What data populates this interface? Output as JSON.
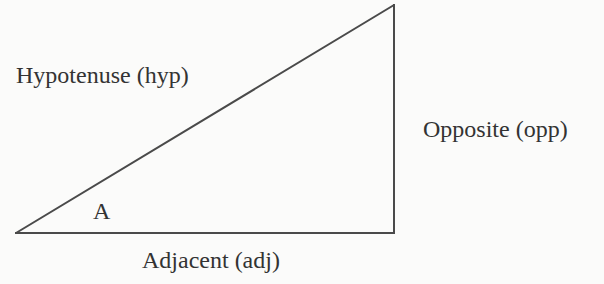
{
  "diagram": {
    "colors": {
      "background": "#fbfbfa",
      "line": "#4a4a4a",
      "text": "#333333"
    },
    "vertices": {
      "angle_a": {
        "x": 16,
        "y": 233
      },
      "right_angle": {
        "x": 394,
        "y": 233
      },
      "top": {
        "x": 394,
        "y": 5
      }
    },
    "labels": {
      "hypotenuse": "Hypotenuse (hyp)",
      "opposite": "Opposite (opp)",
      "adjacent": "Adjacent (adj)",
      "angle": "A"
    }
  }
}
